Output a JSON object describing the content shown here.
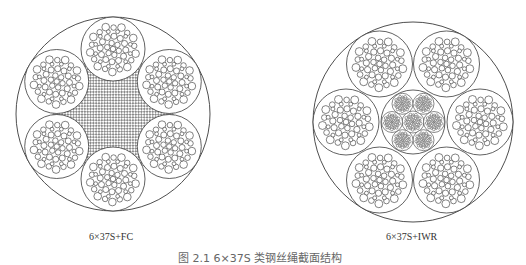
{
  "figure": {
    "diagrams": [
      {
        "id": "left",
        "label": "6×37S+FC",
        "core_type": "fiber",
        "outer_strands": 6,
        "wires_per_strand": 37
      },
      {
        "id": "right",
        "label": "6×37S+IWR",
        "core_type": "independent-wire-rope",
        "outer_strands": 6,
        "wires_per_strand": 37,
        "core_strands": 7
      }
    ],
    "caption": "图 2.1  6×37S 类钢丝绳截面结构"
  },
  "colors": {
    "stroke": "#3a3a3a",
    "background": "#ffffff",
    "hatch": "#555555"
  }
}
